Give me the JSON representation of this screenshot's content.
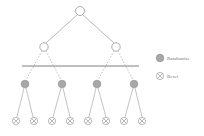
{
  "diagram": {
    "type": "binary-tree",
    "colors": {
      "edge": "#9a9a9a",
      "node_stroke": "#8a8a8a",
      "randomize_fill": "#a8a8a8",
      "cut_line": "#6f6f6f"
    },
    "levels": [
      {
        "level": 0,
        "node_type": "plain",
        "count": 1
      },
      {
        "level": 1,
        "node_type": "plain",
        "count": 2
      },
      {
        "level": 2,
        "node_type": "randomize",
        "count": 4
      },
      {
        "level": 3,
        "node_type": "reset",
        "count": 8
      }
    ],
    "edges": {
      "level0_to_1": "solid",
      "level1_to_2": "dashed",
      "level2_to_3": "solid"
    },
    "cut_line": "horizontal separator between level 1 and level 2"
  },
  "legend": {
    "items": [
      {
        "icon": "randomize-node-icon",
        "label": "Randomize"
      },
      {
        "icon": "reset-node-icon",
        "label": "Reset"
      }
    ]
  }
}
